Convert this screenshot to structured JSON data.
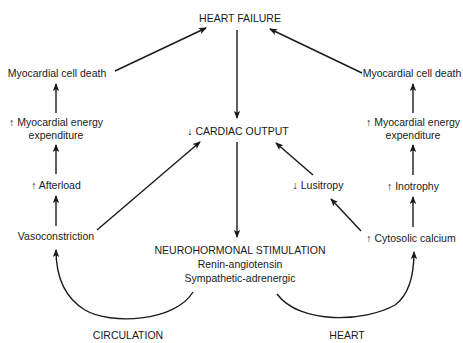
{
  "diagram": {
    "type": "flowchart",
    "nodes": {
      "heart_failure": "HEART FAILURE",
      "cardiac_output": "↓ CARDIAC OUTPUT",
      "left_cell_death": "Myocardial cell death",
      "left_energy_1": "↑ Myocardial energy",
      "left_energy_2": "expenditure",
      "afterload": "↑ Afterload",
      "vasoconstriction": "Vasoconstriction",
      "right_cell_death": "Myocardial cell death",
      "right_energy_1": "↑ Myocardial energy",
      "right_energy_2": "expenditure",
      "inotrophy": "↑ Inotrophy",
      "cytosolic_calcium": "↑ Cytosolic calcium",
      "lusitropy": "↓ Lusitropy",
      "neuro_title": "NEUROHORMONAL STIMULATION",
      "neuro_line1": "Renin-angiotensin",
      "neuro_line2": "Sympathetic-adrenergic"
    },
    "labels": {
      "circulation": "CIRCULATION",
      "heart": "HEART"
    },
    "edges": [
      {
        "from": "heart_failure",
        "to": "cardiac_output"
      },
      {
        "from": "cardiac_output",
        "to": "neuro_title"
      },
      {
        "from": "neuro_title",
        "to": "vasoconstriction",
        "via": "circulation"
      },
      {
        "from": "neuro_title",
        "to": "cytosolic_calcium",
        "via": "heart"
      },
      {
        "from": "vasoconstriction",
        "to": "afterload"
      },
      {
        "from": "afterload",
        "to": "left_energy_1"
      },
      {
        "from": "left_energy_1",
        "to": "left_cell_death"
      },
      {
        "from": "left_cell_death",
        "to": "heart_failure"
      },
      {
        "from": "vasoconstriction",
        "to": "cardiac_output"
      },
      {
        "from": "cytosolic_calcium",
        "to": "inotrophy"
      },
      {
        "from": "inotrophy",
        "to": "right_energy_1"
      },
      {
        "from": "right_energy_1",
        "to": "right_cell_death"
      },
      {
        "from": "right_cell_death",
        "to": "heart_failure"
      },
      {
        "from": "cytosolic_calcium",
        "to": "lusitropy"
      },
      {
        "from": "lusitropy",
        "to": "cardiac_output"
      }
    ]
  }
}
